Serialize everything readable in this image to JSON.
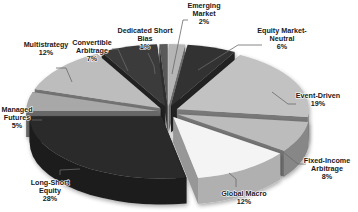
{
  "chart_data": {
    "type": "pie",
    "style": "3d-exploded",
    "title": "",
    "unit": "%",
    "slices": [
      {
        "label": "Long-Short Equity",
        "lines": [
          "Long-Short",
          "Equity",
          "28%"
        ],
        "value": 28,
        "color": "#2b2b2b"
      },
      {
        "label": "Managed Futures",
        "lines": [
          "Managed",
          "Futures",
          "5%"
        ],
        "value": 5,
        "color": "#a8a8a8"
      },
      {
        "label": "Multistrategy",
        "lines": [
          "Multistrategy",
          "12%"
        ],
        "value": 12,
        "color": "#bdbdbd"
      },
      {
        "label": "Convertible Arbitrage",
        "lines": [
          "Convertible",
          "Arbitrage",
          "7%"
        ],
        "value": 7,
        "color": "#3a3a3a"
      },
      {
        "label": "Dedicated Short Bias",
        "lines": [
          "Dedicated Short",
          "Bias",
          "1%"
        ],
        "value": 1,
        "color": "#5a5a5a"
      },
      {
        "label": "Emerging Market",
        "lines": [
          "Emerging",
          "Market",
          "2%"
        ],
        "value": 2,
        "color": "#b5b5b5"
      },
      {
        "label": "Equity Market-Neutral",
        "lines": [
          "Equity Market-",
          "Neutral",
          "6%"
        ],
        "value": 6,
        "color": "#333333"
      },
      {
        "label": "Event-Driven",
        "lines": [
          "Event-Driven",
          "19%"
        ],
        "value": 19,
        "color": "#c2c2c2"
      },
      {
        "label": "Fixed-Income Arbitrage",
        "lines": [
          "Fixed-Income",
          "Arbitrage",
          "8%"
        ],
        "value": 8,
        "color": "#bcbcbc"
      },
      {
        "label": "Global Macro",
        "lines": [
          "Global Macro",
          "12%"
        ],
        "value": 12,
        "color": "#f4f4f4"
      }
    ],
    "legend": "none",
    "data_labels": "outside-with-leaders"
  }
}
